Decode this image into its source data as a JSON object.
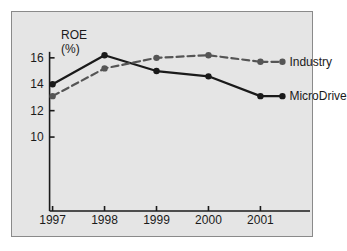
{
  "chart_data": {
    "type": "line",
    "title": "",
    "ylabel": "ROE (%)",
    "ylabel_lines": [
      "ROE",
      "(%)"
    ],
    "xlabel": "",
    "categories": [
      "1997",
      "1998",
      "1999",
      "2000",
      "2001"
    ],
    "x": [
      1997,
      1998,
      1999,
      2000,
      2001
    ],
    "series": [
      {
        "name": "MicroDrive",
        "style": "solid",
        "color": "#1a1a1a",
        "marker": "circle",
        "values": [
          14.0,
          16.2,
          15.0,
          14.6,
          13.1
        ]
      },
      {
        "name": "Industry",
        "style": "dashed",
        "color": "#555555",
        "marker": "circle",
        "values": [
          13.1,
          15.2,
          16.0,
          16.2,
          15.7
        ]
      }
    ],
    "yticks": [
      16,
      14,
      12,
      10
    ],
    "ytick_labels": [
      "16",
      "14",
      "12",
      "10"
    ],
    "ylim": [
      4.4,
      17.2
    ],
    "xlim": [
      1996.7,
      2001.8
    ],
    "grid": false,
    "legend_position": "right-inline",
    "legend": [
      {
        "label": "Industry",
        "style": "dashed"
      },
      {
        "label": "MicroDrive",
        "style": "solid"
      }
    ]
  },
  "figure": {
    "background_color": "#e5e5e5",
    "border_color": "#8a8a8a",
    "axis_color": "#1a1a1a"
  }
}
